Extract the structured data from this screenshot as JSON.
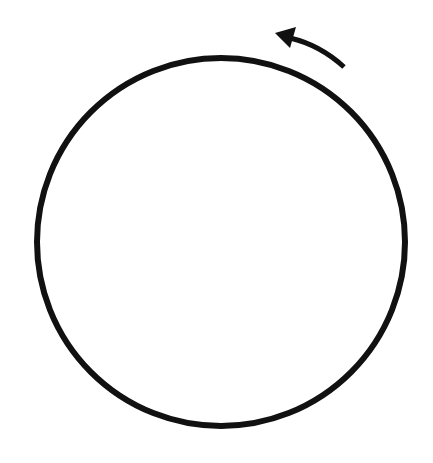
{
  "diagram": {
    "background": "#ffffff",
    "stroke_color": "#111111",
    "circle": {
      "cx": 221,
      "cy": 242,
      "r": 184,
      "stroke_width": 6
    },
    "arrow": {
      "direction": "counter-clockwise",
      "path": "M 344 67 Q 320 45 290 38",
      "stroke_width": 5,
      "head": "275,33 296,27 290,48"
    }
  }
}
